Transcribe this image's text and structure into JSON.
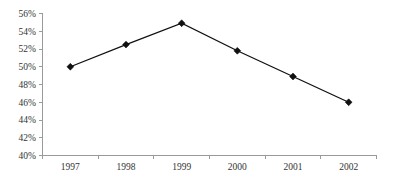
{
  "chart_data": {
    "type": "line",
    "title": "",
    "subtitle": "",
    "xlabel": "",
    "ylabel": "",
    "categories": [
      "1997",
      "1998",
      "1999",
      "2000",
      "2001",
      "2002"
    ],
    "x": [
      "1997",
      "1998",
      "1999",
      "2000",
      "2001",
      "2002"
    ],
    "values": [
      50.0,
      52.5,
      54.9,
      51.8,
      48.9,
      46.0
    ],
    "series": [
      {
        "name": "",
        "values": [
          50.0,
          52.5,
          54.9,
          51.8,
          48.9,
          46.0
        ]
      }
    ],
    "ylim": [
      40,
      56
    ],
    "ytick_step": 2,
    "ytick_values": [
      40,
      42,
      44,
      46,
      48,
      50,
      52,
      54,
      56
    ],
    "ytick_labels": [
      "40%",
      "42%",
      "44%",
      "46%",
      "48%",
      "50%",
      "52%",
      "54%",
      "56%"
    ],
    "xtick_labels": [
      "1997",
      "1998",
      "1999",
      "2000",
      "2001",
      "2002"
    ],
    "grid": false,
    "legend": false,
    "legend_position": "none",
    "marker": "diamond",
    "line_color": "#111111",
    "marker_color": "#111111",
    "axis_color": "#9a9a9a",
    "background_color": "#ffffff",
    "value_suffix": "%",
    "annotations": []
  }
}
